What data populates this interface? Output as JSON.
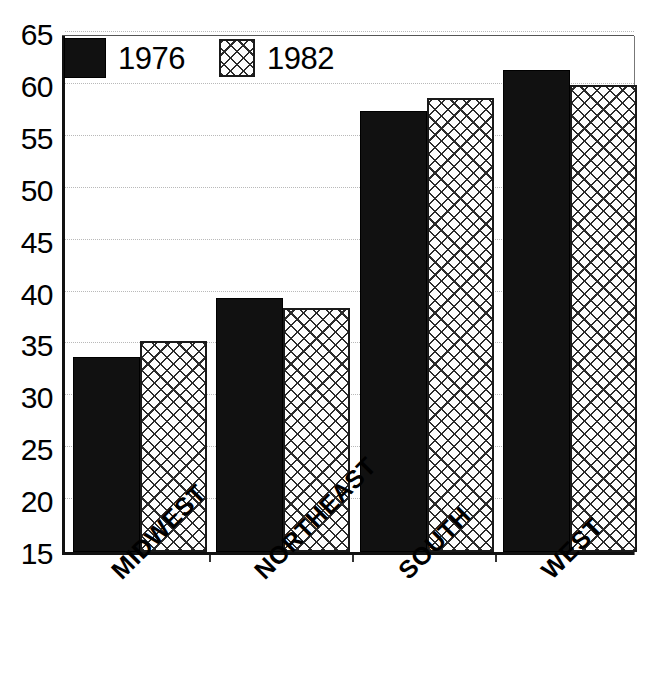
{
  "chart_data": {
    "type": "bar",
    "title": "",
    "subtitle": "",
    "xlabel": "",
    "ylabel": "",
    "categories": [
      "MIDWEST",
      "NORTHEAST",
      "SOUTH",
      "WEST"
    ],
    "series": [
      {
        "name": "1976",
        "values": [
          33.8,
          39.5,
          57.5,
          61.4
        ],
        "fill": "solid-black",
        "color": "#111111"
      },
      {
        "name": "1982",
        "values": [
          35.3,
          38.5,
          58.7,
          60.0
        ],
        "fill": "crosshatch",
        "color": "#ffffff"
      }
    ],
    "ylim": [
      15,
      65
    ],
    "yticks": [
      15,
      20,
      25,
      30,
      35,
      40,
      45,
      50,
      55,
      60,
      65
    ],
    "ytick_labels": [
      "15",
      "20",
      "25",
      "30",
      "35",
      "40",
      "45",
      "50",
      "55",
      "60",
      "65"
    ],
    "grid": true,
    "grid_style": "dotted",
    "grid_axis": "y",
    "legend_position": "top-left",
    "legend_entries": [
      "1976",
      "1982"
    ],
    "xtick_label_rotation": -45,
    "bar_grouping": "grouped"
  },
  "legend": {
    "items": [
      {
        "label": "1976",
        "swatch": "solid-black-swatch"
      },
      {
        "label": "1982",
        "swatch": "crosshatch-swatch"
      }
    ]
  },
  "axes": {
    "y": {
      "min": 15,
      "max": 65,
      "step": 5,
      "ticks": [
        "65",
        "60",
        "55",
        "50",
        "45",
        "40",
        "35",
        "30",
        "25",
        "20",
        "15"
      ]
    },
    "x": {
      "ticks": [
        "MIDWEST",
        "NORTHEAST",
        "SOUTH",
        "WEST"
      ]
    }
  },
  "colors": {
    "series_1976": "#111111",
    "series_1982": "#ffffff",
    "hatch": "#2b2b2b",
    "grid": "#b9b9b9",
    "axis": "#111111",
    "background": "#ffffff"
  }
}
